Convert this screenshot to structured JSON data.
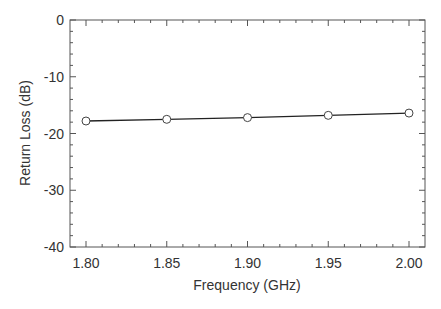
{
  "chart_data": {
    "type": "line",
    "title": "",
    "xlabel": "Frequency  (GHz)",
    "ylabel": "Return Loss  (dB)",
    "x": [
      1.8,
      1.85,
      1.9,
      1.95,
      2.0
    ],
    "series": [
      {
        "name": "Return Loss",
        "values": [
          -17.8,
          -17.5,
          -17.2,
          -16.8,
          -16.4
        ],
        "marker": "open-circle",
        "color": "#222222"
      }
    ],
    "xlim": [
      1.78,
      2.02
    ],
    "ylim": [
      -40,
      0
    ],
    "xticks": [
      "1.80",
      "1.85",
      "1.90",
      "1.95",
      "2.00"
    ],
    "yticks": [
      "0",
      "-10",
      "-20",
      "-30",
      "-40"
    ],
    "grid": false,
    "legend": null
  }
}
